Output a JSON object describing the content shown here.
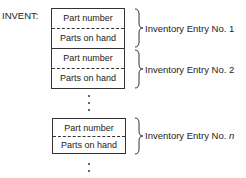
{
  "array_label": "INVENT:",
  "entries": [
    {
      "field1": "Part number",
      "field2": "Parts on hand",
      "label": "Inventory Entry No. 1"
    },
    {
      "field1": "Part number",
      "field2": "Parts on hand",
      "label": "Inventory Entry No. 2"
    },
    {
      "field1": "Part number",
      "field2": "Parts on hand",
      "label_prefix": "Inventory Entry No. ",
      "label_var": "n"
    }
  ],
  "ellipsis": "⋮"
}
